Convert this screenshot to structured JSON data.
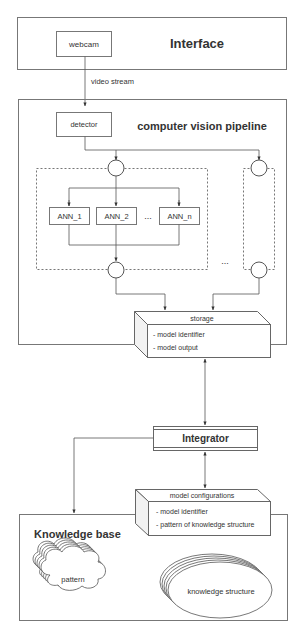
{
  "interface": {
    "title": "Interface",
    "webcam_label": "webcam"
  },
  "edge_labels": {
    "video_stream": "video stream"
  },
  "pipeline": {
    "title": "computer vision pipeline",
    "detector_label": "detector",
    "ann_nodes": [
      "ANN_1",
      "ANN_2",
      "ANN_n"
    ],
    "ellipsis_inner": "...",
    "ellipsis_outer": "..."
  },
  "storage": {
    "title": "storage",
    "items": [
      "- model identifier",
      "- model output"
    ]
  },
  "integrator": {
    "title": "Integrator"
  },
  "model_configurations": {
    "title": "model configurations",
    "items": [
      "- model identifier",
      "- pattern of knowledge structure"
    ]
  },
  "knowledge_base": {
    "title": "Knowledge base",
    "pattern_label": "pattern",
    "structure_label": "knowledge structure"
  },
  "colors": {
    "stroke": "#555555",
    "text": "#333333",
    "box_fill": "#ffffff",
    "side_fill": "#f2f2f2"
  }
}
